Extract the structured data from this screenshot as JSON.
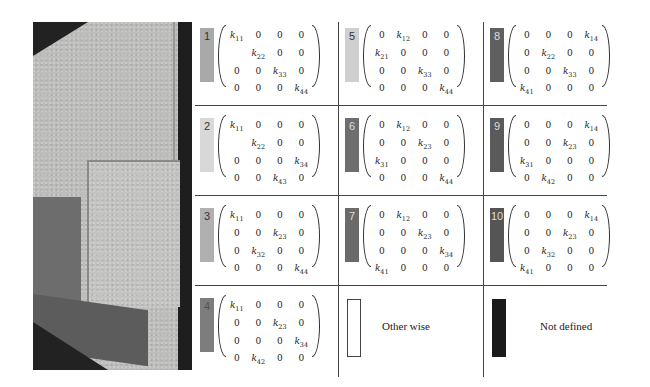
{
  "figure": {
    "photo": {
      "description": "grayscale photograph of overlapping rectangular panels"
    },
    "cells": [
      {
        "id": "1",
        "swatch_color": "#a9a9a9",
        "text_color": "#333333",
        "matrix": [
          [
            "k11",
            "0",
            "0",
            "0"
          ],
          [
            "",
            "k22",
            "0",
            "0"
          ],
          [
            "0",
            "0",
            "k33",
            "0"
          ],
          [
            "0",
            "0",
            "0",
            "k44"
          ]
        ]
      },
      {
        "id": "2",
        "swatch_color": "#d8d8d8",
        "text_color": "#333333",
        "matrix": [
          [
            "k11",
            "0",
            "0",
            "0"
          ],
          [
            "",
            "k22",
            "0",
            "0"
          ],
          [
            "0",
            "0",
            "0",
            "k34"
          ],
          [
            "0",
            "0",
            "k43",
            "0"
          ]
        ]
      },
      {
        "id": "3",
        "swatch_color": "#b0b0b0",
        "text_color": "#333333",
        "matrix": [
          [
            "k11",
            "0",
            "0",
            "0"
          ],
          [
            "0",
            "0",
            "k23",
            "0"
          ],
          [
            "0",
            "k32",
            "0",
            "0"
          ],
          [
            "0",
            "0",
            "0",
            "k44"
          ]
        ]
      },
      {
        "id": "4",
        "swatch_color": "#7d7d7d",
        "text_color": "#555555",
        "matrix": [
          [
            "k11",
            "0",
            "0",
            "0"
          ],
          [
            "0",
            "0",
            "k23",
            "0"
          ],
          [
            "0",
            "0",
            "0",
            "k34"
          ],
          [
            "0",
            "k42",
            "0",
            "0"
          ]
        ]
      },
      {
        "id": "5",
        "swatch_color": "#cfcfcf",
        "text_color": "#333333",
        "matrix": [
          [
            "0",
            "k12",
            "0",
            "0"
          ],
          [
            "k21",
            "0",
            "0",
            "0"
          ],
          [
            "0",
            "0",
            "k33",
            "0"
          ],
          [
            "0",
            "0",
            "0",
            "k44"
          ]
        ]
      },
      {
        "id": "6",
        "swatch_color": "#6e6e6e",
        "text_color": "#dddddd",
        "matrix": [
          [
            "0",
            "k12",
            "0",
            "0"
          ],
          [
            "0",
            "0",
            "k23",
            "0"
          ],
          [
            "k31",
            "0",
            "0",
            "0"
          ],
          [
            "0",
            "0",
            "0",
            "k44"
          ]
        ]
      },
      {
        "id": "7",
        "swatch_color": "#6a6a6a",
        "text_color": "#dddddd",
        "matrix": [
          [
            "0",
            "k12",
            "0",
            "0"
          ],
          [
            "0",
            "0",
            "k23",
            "0"
          ],
          [
            "0",
            "0",
            "0",
            "k34"
          ],
          [
            "k41",
            "0",
            "0",
            "0"
          ]
        ]
      },
      {
        "id": "8",
        "swatch_color": "#5f5f5f",
        "text_color": "#dddddd",
        "matrix": [
          [
            "0",
            "0",
            "0",
            "k14"
          ],
          [
            "0",
            "k22",
            "0",
            "0"
          ],
          [
            "0",
            "0",
            "k33",
            "0"
          ],
          [
            "k41",
            "0",
            "0",
            "0"
          ]
        ]
      },
      {
        "id": "9",
        "swatch_color": "#5a5a5a",
        "text_color": "#dddddd",
        "matrix": [
          [
            "0",
            "0",
            "0",
            "k14"
          ],
          [
            "0",
            "0",
            "k23",
            "0"
          ],
          [
            "k31",
            "0",
            "0",
            "0"
          ],
          [
            "0",
            "k42",
            "0",
            "0"
          ]
        ]
      },
      {
        "id": "10",
        "swatch_color": "#555555",
        "text_color": "#dddddd",
        "matrix": [
          [
            "0",
            "0",
            "0",
            "k14"
          ],
          [
            "0",
            "0",
            "k23",
            "0"
          ],
          [
            "0",
            "k32",
            "0",
            "0"
          ],
          [
            "k41",
            "0",
            "0",
            "0"
          ]
        ]
      }
    ],
    "legend": [
      {
        "label": "Other wise",
        "swatch_color": "#ffffff",
        "border": "#444444"
      },
      {
        "label": "Not defined",
        "swatch_color": "#1a1a1a",
        "border": "#1a1a1a"
      }
    ]
  }
}
